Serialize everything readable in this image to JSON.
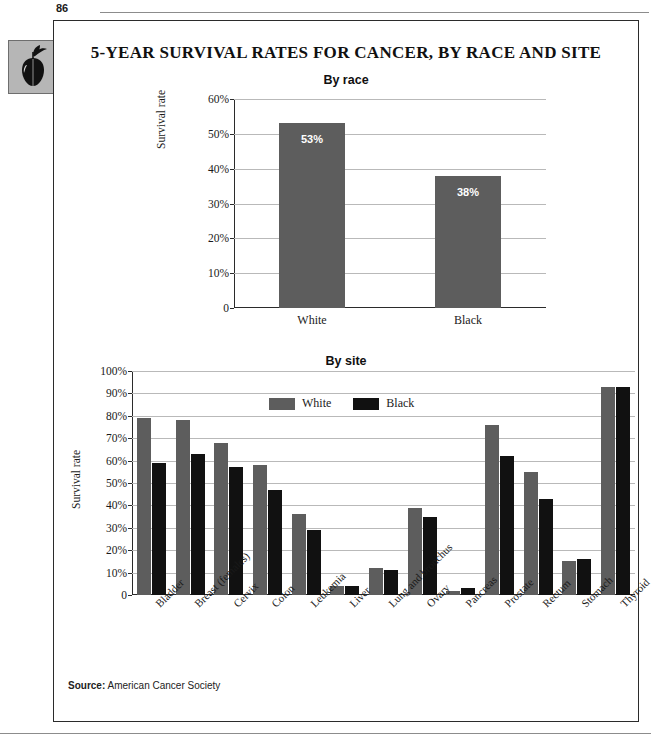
{
  "page": {
    "number": "86",
    "title": "5-YEAR SURVIVAL RATES FOR CANCER, BY RACE AND SITE",
    "badge_icon": "apple-icon"
  },
  "source": {
    "label": "Source:",
    "value": "American Cancer Society"
  },
  "colors": {
    "white_series": "#5d5d5d",
    "black_series": "#111111",
    "gridline": "#b9b9b9",
    "axis": "#2b2b2b",
    "frame": "#2b2b2b",
    "badge_bg": "#b6b6b6"
  },
  "legend": {
    "items": [
      {
        "label": "White",
        "color": "#5d5d5d",
        "swatch": "white-series-swatch"
      },
      {
        "label": "Black",
        "color": "#111111",
        "swatch": "black-series-swatch"
      }
    ]
  },
  "chart_data": [
    {
      "id": "by-race",
      "type": "bar",
      "title": "By race",
      "xlabel": "",
      "ylabel": "Survival rate",
      "ylim": [
        0,
        60
      ],
      "yticks": [
        "0",
        "10%",
        "20%",
        "30%",
        "40%",
        "50%",
        "60%"
      ],
      "ytick_values": [
        0,
        10,
        20,
        30,
        40,
        50,
        60
      ],
      "grid": true,
      "legend_position": "none",
      "categories": [
        "White",
        "Black"
      ],
      "values": [
        53,
        38
      ],
      "data_labels": [
        "53%",
        "38%"
      ]
    },
    {
      "id": "by-site",
      "type": "bar",
      "title": "By site",
      "xlabel": "",
      "ylabel": "Survival rate",
      "ylim": [
        0,
        100
      ],
      "yticks": [
        "0",
        "10%",
        "20%",
        "30%",
        "40%",
        "50%",
        "60%",
        "70%",
        "80%",
        "90%",
        "100%"
      ],
      "ytick_values": [
        0,
        10,
        20,
        30,
        40,
        50,
        60,
        70,
        80,
        90,
        100
      ],
      "grid": true,
      "legend_position": "top-center",
      "categories": [
        "Bladder",
        "Breast (females)",
        "Cervix",
        "Colon",
        "Leukemia",
        "Liver",
        "Lung and bronchus",
        "Ovary",
        "Pancreas",
        "Prostate",
        "Rectum",
        "Stomach",
        "Thyroid"
      ],
      "series": [
        {
          "name": "White",
          "color": "#5d5d5d",
          "values": [
            79,
            78,
            68,
            58,
            36,
            4,
            12,
            39,
            2,
            76,
            55,
            15,
            93
          ]
        },
        {
          "name": "Black",
          "color": "#111111",
          "values": [
            59,
            63,
            57,
            47,
            29,
            4,
            11,
            35,
            3,
            62,
            43,
            16,
            93
          ]
        }
      ]
    }
  ]
}
